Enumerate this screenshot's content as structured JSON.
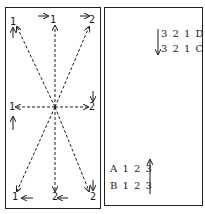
{
  "left_panel": {
    "labels": {
      "top_left": "1",
      "top_center": "1",
      "top_right": "2",
      "mid_left": "1",
      "mid_right": "2",
      "bottom_left": "1",
      "bottom_center": "2",
      "bottom_right": "2"
    },
    "center": [
      55,
      107
    ],
    "arrow_style": "dashed"
  },
  "right_panel": {
    "top_codes": [
      "3 2 1 D",
      "3 2 1 C"
    ],
    "bottom_codes": [
      "A 1 2 3",
      "B 1 2 3"
    ],
    "top_arrow": "down-arrow",
    "bottom_arrow": "up-arrow"
  },
  "colors": {
    "ink": "#1a1a1a",
    "background": "#ffffff"
  }
}
